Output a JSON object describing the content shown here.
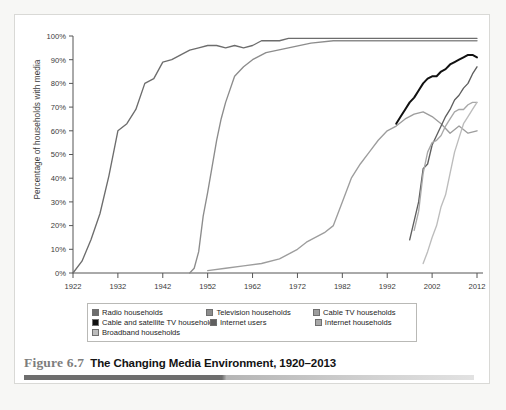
{
  "figure": {
    "number_label": "Figure 6.7",
    "title": "The Changing Media Environment, 1920–2013"
  },
  "chart_data": {
    "type": "line",
    "title": "The Changing Media Environment, 1920–2013",
    "xlabel": "",
    "ylabel": "Percentage of households with media",
    "xlim": [
      1922,
      2012
    ],
    "ylim": [
      0,
      100
    ],
    "grid": false,
    "legend_position": "bottom",
    "xticks": [
      1922,
      1932,
      1942,
      1952,
      1962,
      1972,
      1982,
      1992,
      2002,
      2012
    ],
    "yticks": [
      "0%",
      "10%",
      "20%",
      "30%",
      "40%",
      "50%",
      "60%",
      "70%",
      "80%",
      "90%",
      "100%"
    ],
    "series": [
      {
        "name": "Radio households",
        "color": "#6d6d6d",
        "x": [
          1922,
          1924,
          1926,
          1928,
          1930,
          1932,
          1934,
          1936,
          1938,
          1940,
          1942,
          1944,
          1946,
          1948,
          1950,
          1952,
          1954,
          1956,
          1958,
          1960,
          1962,
          1964,
          1966,
          1968,
          1970,
          1980,
          1990,
          2000,
          2012
        ],
        "values": [
          0,
          5,
          14,
          25,
          41,
          60,
          63,
          69,
          80,
          82,
          89,
          90,
          92,
          94,
          95,
          96,
          96,
          95,
          96,
          95,
          96,
          98,
          98,
          98,
          99,
          99,
          99,
          99,
          99
        ]
      },
      {
        "name": "Television households",
        "color": "#8c8c8c",
        "x": [
          1948,
          1949,
          1950,
          1951,
          1952,
          1953,
          1954,
          1955,
          1956,
          1958,
          1960,
          1962,
          1965,
          1970,
          1975,
          1980,
          1990,
          2000,
          2012
        ],
        "values": [
          0,
          2,
          9,
          24,
          34,
          45,
          56,
          65,
          72,
          83,
          87,
          90,
          93,
          95,
          97,
          98,
          98,
          98,
          98
        ]
      },
      {
        "name": "Cable TV households",
        "color": "#9d9d9d",
        "x": [
          1952,
          1956,
          1960,
          1964,
          1968,
          1970,
          1972,
          1974,
          1976,
          1978,
          1980,
          1982,
          1984,
          1986,
          1988,
          1990,
          1992,
          1994,
          1996,
          1998,
          2000,
          2002,
          2004,
          2006,
          2008,
          2010,
          2012
        ],
        "values": [
          1,
          2,
          3,
          4,
          6,
          8,
          10,
          13,
          15,
          17,
          20,
          30,
          40,
          46,
          51,
          56,
          60,
          62,
          65,
          67,
          68,
          66,
          63,
          59,
          62,
          59,
          60
        ]
      },
      {
        "name": "Cable and satellite TV households",
        "color": "#111111",
        "x": [
          1994,
          1995,
          1996,
          1997,
          1998,
          1999,
          2000,
          2001,
          2002,
          2003,
          2004,
          2005,
          2006,
          2007,
          2008,
          2009,
          2010,
          2011,
          2012
        ],
        "values": [
          63,
          66,
          69,
          72,
          74,
          77,
          80,
          82,
          83,
          83,
          85,
          86,
          88,
          89,
          90,
          91,
          92,
          92,
          91
        ]
      },
      {
        "name": "Internet users",
        "color": "#5f5f5f",
        "x": [
          1997,
          1998,
          1999,
          2000,
          2001,
          2002,
          2003,
          2004,
          2005,
          2006,
          2007,
          2008,
          2009,
          2010,
          2011,
          2012
        ],
        "values": [
          14,
          22,
          30,
          44,
          46,
          54,
          58,
          62,
          66,
          69,
          73,
          75,
          78,
          80,
          84,
          87
        ]
      },
      {
        "name": "Internet households",
        "color": "#a8a8a8",
        "x": [
          1998,
          1999,
          2000,
          2001,
          2002,
          2003,
          2004,
          2005,
          2006,
          2007,
          2008,
          2009,
          2010,
          2011,
          2012
        ],
        "values": [
          18,
          26,
          42,
          51,
          55,
          56,
          58,
          62,
          65,
          68,
          69,
          69,
          71,
          72,
          72
        ]
      },
      {
        "name": "Broadband households",
        "color": "#bcbcbc",
        "x": [
          2000,
          2001,
          2002,
          2003,
          2004,
          2005,
          2006,
          2007,
          2008,
          2009,
          2010,
          2011,
          2012
        ],
        "values": [
          4,
          9,
          15,
          20,
          28,
          33,
          42,
          51,
          57,
          63,
          66,
          69,
          72
        ]
      }
    ]
  },
  "legend": {
    "rows": [
      [
        {
          "label": "Radio households",
          "color": "#6d6d6d"
        },
        {
          "label": "Television households",
          "color": "#8c8c8c"
        },
        {
          "label": "Cable TV households",
          "color": "#9d9d9d"
        }
      ],
      [
        {
          "label": "Cable and satellite TV households",
          "color": "#111111"
        },
        {
          "label": "Internet users",
          "color": "#5f5f5f"
        },
        {
          "label": "Internet households",
          "color": "#a8a8a8"
        }
      ],
      [
        {
          "label": "Broadband households",
          "color": "#bcbcbc"
        }
      ]
    ]
  }
}
